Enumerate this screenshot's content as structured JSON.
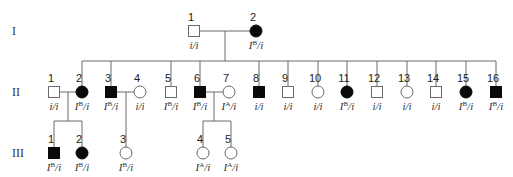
{
  "generations": [
    {
      "label": "I",
      "y": 31
    },
    {
      "label": "II",
      "y": 92
    },
    {
      "label": "III",
      "y": 153
    }
  ],
  "individuals": [
    {
      "id": "I-1",
      "gen": 0,
      "num": "1",
      "sex": "male",
      "affected": false,
      "x": 194,
      "genotype": {
        "a1": "i",
        "sup1": "",
        "a2": "i"
      }
    },
    {
      "id": "I-2",
      "gen": 0,
      "num": "2",
      "sex": "female",
      "affected": true,
      "x": 256,
      "genotype": {
        "a1": "I",
        "sup1": "B",
        "a2": "i"
      }
    },
    {
      "id": "II-1",
      "gen": 1,
      "num": "1",
      "sex": "male",
      "affected": false,
      "x": 54,
      "genotype": {
        "a1": "i",
        "sup1": "",
        "a2": "i"
      }
    },
    {
      "id": "II-2",
      "gen": 1,
      "num": "2",
      "sex": "female",
      "affected": true,
      "x": 82,
      "genotype": {
        "a1": "I",
        "sup1": "B",
        "a2": "i"
      }
    },
    {
      "id": "II-3",
      "gen": 1,
      "num": "3",
      "sex": "male",
      "affected": true,
      "x": 111,
      "genotype": {
        "a1": "I",
        "sup1": "B",
        "a2": "i"
      }
    },
    {
      "id": "II-4",
      "gen": 1,
      "num": "4",
      "sex": "female",
      "affected": false,
      "x": 140,
      "genotype": {
        "a1": "i",
        "sup1": "",
        "a2": "i"
      }
    },
    {
      "id": "II-5",
      "gen": 1,
      "num": "5",
      "sex": "male",
      "affected": false,
      "x": 171,
      "genotype": {
        "a1": "I",
        "sup1": "B",
        "a2": "i"
      }
    },
    {
      "id": "II-6",
      "gen": 1,
      "num": "6",
      "sex": "male",
      "affected": true,
      "x": 200,
      "genotype": {
        "a1": "I",
        "sup1": "B",
        "a2": "i"
      }
    },
    {
      "id": "II-7",
      "gen": 1,
      "num": "7",
      "sex": "female",
      "affected": false,
      "x": 229,
      "genotype": {
        "a1": "I",
        "sup1": "A",
        "a2": "i"
      }
    },
    {
      "id": "II-8",
      "gen": 1,
      "num": "8",
      "sex": "male",
      "affected": true,
      "x": 259,
      "genotype": {
        "a1": "i",
        "sup1": "",
        "a2": "i"
      }
    },
    {
      "id": "II-9",
      "gen": 1,
      "num": "9",
      "sex": "male",
      "affected": false,
      "x": 288,
      "genotype": {
        "a1": "i",
        "sup1": "",
        "a2": "i"
      }
    },
    {
      "id": "II-10",
      "gen": 1,
      "num": "10",
      "sex": "female",
      "affected": false,
      "x": 318,
      "genotype": {
        "a1": "i",
        "sup1": "",
        "a2": "i"
      }
    },
    {
      "id": "II-11",
      "gen": 1,
      "num": "11",
      "sex": "female",
      "affected": true,
      "x": 347,
      "genotype": {
        "a1": "I",
        "sup1": "B",
        "a2": "i"
      }
    },
    {
      "id": "II-12",
      "gen": 1,
      "num": "12",
      "sex": "male",
      "affected": false,
      "x": 377,
      "genotype": {
        "a1": "i",
        "sup1": "",
        "a2": "i"
      }
    },
    {
      "id": "II-13",
      "gen": 1,
      "num": "13",
      "sex": "female",
      "affected": false,
      "x": 407,
      "genotype": {
        "a1": "i",
        "sup1": "",
        "a2": "i"
      }
    },
    {
      "id": "II-14",
      "gen": 1,
      "num": "14",
      "sex": "male",
      "affected": false,
      "x": 436,
      "genotype": {
        "a1": "i",
        "sup1": "",
        "a2": "i"
      }
    },
    {
      "id": "II-15",
      "gen": 1,
      "num": "15",
      "sex": "female",
      "affected": true,
      "x": 466,
      "genotype": {
        "a1": "I",
        "sup1": "B",
        "a2": "i"
      }
    },
    {
      "id": "II-16",
      "gen": 1,
      "num": "16",
      "sex": "male",
      "affected": true,
      "x": 496,
      "genotype": {
        "a1": "I",
        "sup1": "B",
        "a2": "i"
      }
    },
    {
      "id": "III-1",
      "gen": 2,
      "num": "1",
      "sex": "male",
      "affected": true,
      "x": 54,
      "genotype": {
        "a1": "I",
        "sup1": "B",
        "a2": "i"
      }
    },
    {
      "id": "III-2",
      "gen": 2,
      "num": "2",
      "sex": "female",
      "affected": true,
      "x": 82,
      "genotype": {
        "a1": "I",
        "sup1": "B",
        "a2": "i"
      }
    },
    {
      "id": "III-3",
      "gen": 2,
      "num": "3",
      "sex": "female",
      "affected": false,
      "x": 126,
      "genotype": {
        "a1": "I",
        "sup1": "B",
        "a2": "i"
      }
    },
    {
      "id": "III-4",
      "gen": 2,
      "num": "4",
      "sex": "female",
      "affected": false,
      "x": 203,
      "genotype": {
        "a1": "I",
        "sup1": "A",
        "a2": "i"
      }
    },
    {
      "id": "III-5",
      "gen": 2,
      "num": "5",
      "sex": "female",
      "affected": false,
      "x": 231,
      "genotype": {
        "a1": "I",
        "sup1": "A",
        "a2": "i"
      }
    }
  ],
  "matings": [
    {
      "a": "I-1",
      "b": "I-2",
      "dropX": 225,
      "children": [
        "II-2",
        "II-3",
        "II-5",
        "II-6",
        "II-8",
        "II-9",
        "II-10",
        "II-11",
        "II-12",
        "II-13",
        "II-14",
        "II-15",
        "II-16"
      ]
    },
    {
      "a": "II-1",
      "b": "II-2",
      "dropX": 68,
      "children": [
        "III-1",
        "III-2"
      ]
    },
    {
      "a": "II-3",
      "b": "II-4",
      "dropX": 126,
      "children": [
        "III-3"
      ]
    },
    {
      "a": "II-6",
      "b": "II-7",
      "dropX": 214,
      "children": [
        "III-4",
        "III-5"
      ]
    }
  ],
  "colors": {
    "line": "#6b6b6b",
    "affected": "#0a0a0a",
    "unaffected": "#ffffff"
  }
}
